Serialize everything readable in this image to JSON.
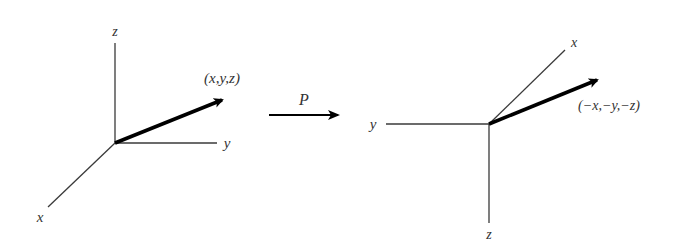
{
  "diagram": {
    "operator": {
      "label": "P"
    },
    "left_frame": {
      "axes": {
        "x": "x",
        "y": "y",
        "z": "z"
      },
      "vector_label": "(x,y,z)"
    },
    "right_frame": {
      "axes": {
        "x": "x",
        "y": "y",
        "z": "z"
      },
      "vector_label": "(−x,−y,−z)"
    },
    "colors": {
      "ink": "#000000",
      "axis": "#3a3a3a",
      "text": "#333333",
      "background": "#ffffff"
    }
  }
}
